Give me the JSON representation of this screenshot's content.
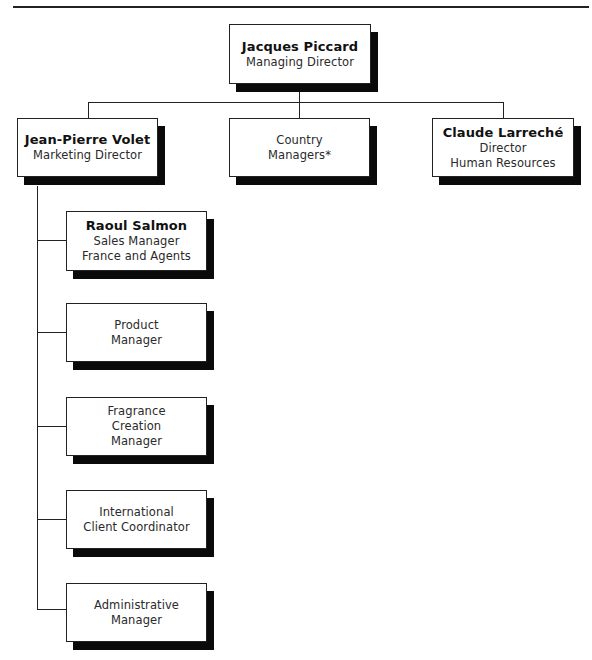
{
  "chart_title": "",
  "nodes": {
    "top": {
      "name": "Jacques Piccard",
      "title_lines": [
        "Managing Director"
      ]
    },
    "marketing": {
      "name": "Jean-Pierre Volet",
      "title_lines": [
        "Marketing Director"
      ]
    },
    "country": {
      "name": "",
      "title_lines": [
        "Country",
        "Managers*"
      ]
    },
    "hr": {
      "name": "Claude Larreché",
      "title_lines": [
        "Director",
        "Human Resources"
      ]
    },
    "sales": {
      "name": "Raoul Salmon",
      "title_lines": [
        "Sales Manager",
        "France and Agents"
      ]
    },
    "product": {
      "name": "",
      "title_lines": [
        "Product",
        "Manager"
      ]
    },
    "fragrance": {
      "name": "",
      "title_lines": [
        "Fragrance",
        "Creation",
        "Manager"
      ]
    },
    "international": {
      "name": "",
      "title_lines": [
        "International",
        "Client Coordinator"
      ]
    },
    "admin": {
      "name": "",
      "title_lines": [
        "Administrative",
        "Manager"
      ]
    }
  },
  "hierarchy": {
    "Jacques Piccard": [
      "Jean-Pierre Volet",
      "Country Managers*",
      "Claude Larreché"
    ],
    "Jean-Pierre Volet": [
      "Raoul Salmon",
      "Product Manager",
      "Fragrance Creation Manager",
      "International Client Coordinator",
      "Administrative Manager"
    ]
  }
}
